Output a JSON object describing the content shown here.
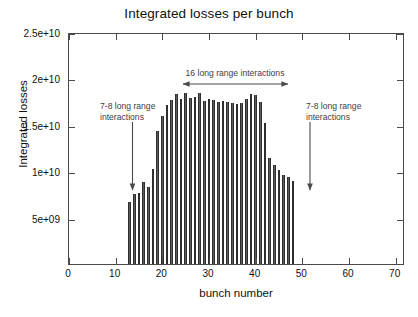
{
  "chart_data": {
    "type": "bar",
    "title": "Integrated losses per bunch",
    "xlabel": "bunch number",
    "ylabel": "Integrated losses",
    "xlim": [
      0,
      72
    ],
    "ylim": [
      0,
      25000000000
    ],
    "xticks": [
      0,
      10,
      20,
      30,
      40,
      50,
      60,
      70
    ],
    "xtick_labels": [
      "0",
      "10",
      "20",
      "30",
      "40",
      "50",
      "60",
      "70"
    ],
    "yticks": [
      5000000000,
      10000000000,
      15000000000,
      20000000000,
      25000000000
    ],
    "ytick_labels": [
      "5e+09",
      "1e+10",
      "1.5e+10",
      "2e+10",
      "2.5e+10"
    ],
    "grid": false,
    "legend": null,
    "bar_color": "#5c5c5c",
    "x": [
      13,
      14,
      15,
      16,
      17,
      18,
      19,
      20,
      21,
      22,
      23,
      24,
      25,
      26,
      27,
      28,
      29,
      30,
      31,
      32,
      33,
      34,
      35,
      36,
      37,
      38,
      39,
      40,
      41,
      42,
      43,
      44,
      45,
      46,
      47,
      48
    ],
    "values": [
      6700000000,
      7500000000,
      7700000000,
      8800000000,
      8300000000,
      10200000000,
      14300000000,
      15900000000,
      17100000000,
      17700000000,
      18300000000,
      17800000000,
      18400000000,
      17900000000,
      18000000000,
      18400000000,
      17600000000,
      17800000000,
      17700000000,
      17500000000,
      17600000000,
      17500000000,
      17400000000,
      17200000000,
      17400000000,
      17800000000,
      18300000000,
      18200000000,
      17500000000,
      15200000000,
      11400000000,
      10700000000,
      10100000000,
      9600000000,
      9400000000,
      8900000000
    ],
    "annotations": [
      {
        "name": "mid-span-annotation",
        "text": "16 long range interactions",
        "marker": "double-headed-horizontal-arrow"
      },
      {
        "name": "left-annotation",
        "text": "7-8 long range\ninteractions",
        "marker": "down-arrow"
      },
      {
        "name": "right-annotation",
        "text": "7-8 long range\ninteractions",
        "marker": "down-arrow"
      }
    ]
  }
}
